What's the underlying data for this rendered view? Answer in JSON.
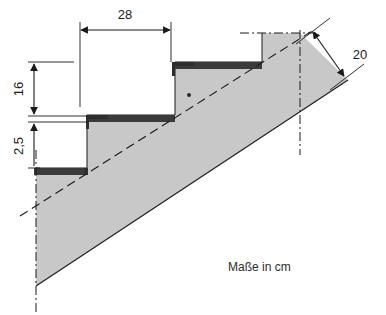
{
  "figure": {
    "caption": "Maße in cm",
    "unit": "cm",
    "colors": {
      "slab_fill": "#c8c8c8",
      "tread_fill": "#3a3a3a",
      "line": "#1a1a1a",
      "background": "#ffffff",
      "text": "#1a1a1a"
    }
  },
  "dimensions": [
    {
      "id": "tread-depth",
      "label": "28",
      "value": 28,
      "unit": "cm",
      "orientation": "horizontal",
      "meaning": "Auftrittstiefe der Stufe",
      "x1": 80,
      "x2": 171,
      "y": 30,
      "label_x": 125,
      "label_y": 23
    },
    {
      "id": "step-rise",
      "label": "16",
      "value": 16,
      "unit": "cm",
      "orientation": "vertical",
      "meaning": "Steigungshoehe der Stufe",
      "x": 34,
      "y1": 63,
      "y2": 115,
      "label_x": 23,
      "label_y": 89
    },
    {
      "id": "tread-thickness",
      "label": "2,5",
      "value": 2.5,
      "unit": "cm",
      "orientation": "vertical",
      "meaning": "Belagsdicke / Trittstufendicke",
      "x": 34,
      "y1": 121,
      "y2": 168,
      "label_x": 23,
      "label_y": 146
    },
    {
      "id": "slab-thickness",
      "label": "20",
      "value": 20,
      "unit": "cm",
      "orientation": "diagonal",
      "meaning": "Plattendicke senkrecht zur Laufplatte",
      "x1": 312,
      "y1": 31,
      "x2": 345,
      "y2": 78,
      "label_x": 360,
      "label_y": 55
    }
  ],
  "geometry": {
    "slab_top_line": {
      "x1": 36,
      "y1": 206,
      "x2": 310,
      "y2": 32
    },
    "slab_bottom_line": {
      "x1": 36,
      "y1": 286,
      "x2": 348,
      "y2": 80
    },
    "center_dash_left": {
      "x": 36,
      "y1": 158,
      "y2": 310
    },
    "center_dash_right": {
      "x": 300,
      "y1": 33,
      "y2": 152
    },
    "center_dash_top": {
      "x1": 243,
      "y1": 33,
      "x2": 312,
      "y2": 33
    },
    "marker_dot": {
      "x": 189,
      "y": 95,
      "r": 2
    },
    "steps": [
      {
        "index": 1,
        "tread_x1": 34,
        "tread_x2": 87,
        "tread_y": 168,
        "tread_h": 7,
        "riser_x": 87
      },
      {
        "index": 2,
        "tread_x1": 86,
        "tread_x2": 175,
        "tread_y": 115,
        "tread_h": 7,
        "riser_x": 175
      },
      {
        "index": 3,
        "tread_x1": 172,
        "tread_x2": 262,
        "tread_y": 62,
        "tread_h": 7,
        "riser_x": 262
      }
    ]
  }
}
